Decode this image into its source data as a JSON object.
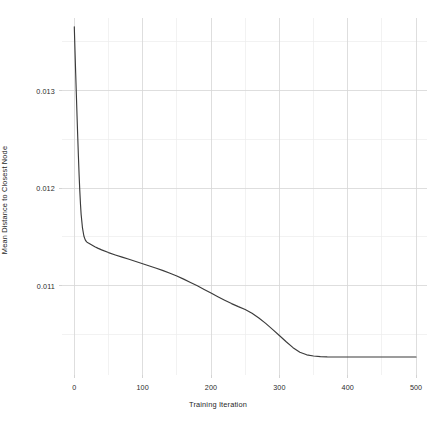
{
  "chart_data": {
    "type": "line",
    "title": "",
    "xlabel": "Training Iteration",
    "ylabel": "Mean Distance to Closest Node",
    "xlim": [
      -18,
      516
    ],
    "ylim": [
      0.010085,
      0.013745
    ],
    "xticks": [
      0,
      100,
      200,
      300,
      400,
      500
    ],
    "xtick_labels": [
      "0",
      "100",
      "200",
      "300",
      "400",
      "500"
    ],
    "yticks": [
      0.011,
      0.012,
      0.013
    ],
    "ytick_labels": [
      "0.011",
      "0.012",
      "0.013"
    ],
    "minor_xticks": [
      50,
      150,
      250,
      350,
      450
    ],
    "minor_yticks": [
      0.0105,
      0.0115,
      0.0125,
      0.0135
    ],
    "grid": true,
    "legend": null,
    "series": [
      {
        "name": "Mean Distance to Closest Node",
        "color": "#3b3b3b",
        "x": [
          0,
          1,
          2,
          3,
          4,
          5,
          6,
          7,
          8,
          9,
          10,
          12,
          14,
          16,
          18,
          20,
          25,
          30,
          35,
          40,
          50,
          60,
          70,
          80,
          90,
          100,
          110,
          120,
          130,
          140,
          150,
          160,
          170,
          180,
          190,
          200,
          210,
          220,
          230,
          240,
          250,
          260,
          270,
          280,
          290,
          300,
          310,
          320,
          330,
          340,
          350,
          360,
          370,
          380,
          400,
          420,
          440,
          460,
          480,
          500
        ],
        "y": [
          0.013655,
          0.01341,
          0.01318,
          0.01296,
          0.01274,
          0.01253,
          0.01233,
          0.01214,
          0.01198,
          0.01184,
          0.01173,
          0.01159,
          0.01151,
          0.01147,
          0.01145,
          0.01144,
          0.01142,
          0.0114,
          0.011383,
          0.011368,
          0.01134,
          0.011316,
          0.011293,
          0.011271,
          0.011248,
          0.011226,
          0.011203,
          0.01118,
          0.011155,
          0.011129,
          0.0111,
          0.011068,
          0.011034,
          0.010999,
          0.010962,
          0.010925,
          0.010888,
          0.010852,
          0.010817,
          0.010786,
          0.010757,
          0.010718,
          0.01067,
          0.010614,
          0.010553,
          0.01049,
          0.010426,
          0.010365,
          0.010319,
          0.010292,
          0.01028,
          0.010274,
          0.010271,
          0.01027,
          0.01027,
          0.01027,
          0.01027,
          0.01027,
          0.01027,
          0.01027
        ]
      }
    ]
  },
  "axes": {
    "x_title": "Training Iteration",
    "y_title": "Mean Distance to Closest Node",
    "x_tick_labels": [
      "0",
      "100",
      "200",
      "300",
      "400",
      "500"
    ],
    "y_tick_labels": [
      "0.011",
      "0.012",
      "0.013"
    ]
  },
  "style": {
    "background": "#ffffff",
    "line_color": "#3b3b3b",
    "major_grid_color": "#d6d6d6",
    "minor_grid_color": "#ececec",
    "tick_color": "#c9c9c9",
    "text_color": "#2b2b2b"
  }
}
